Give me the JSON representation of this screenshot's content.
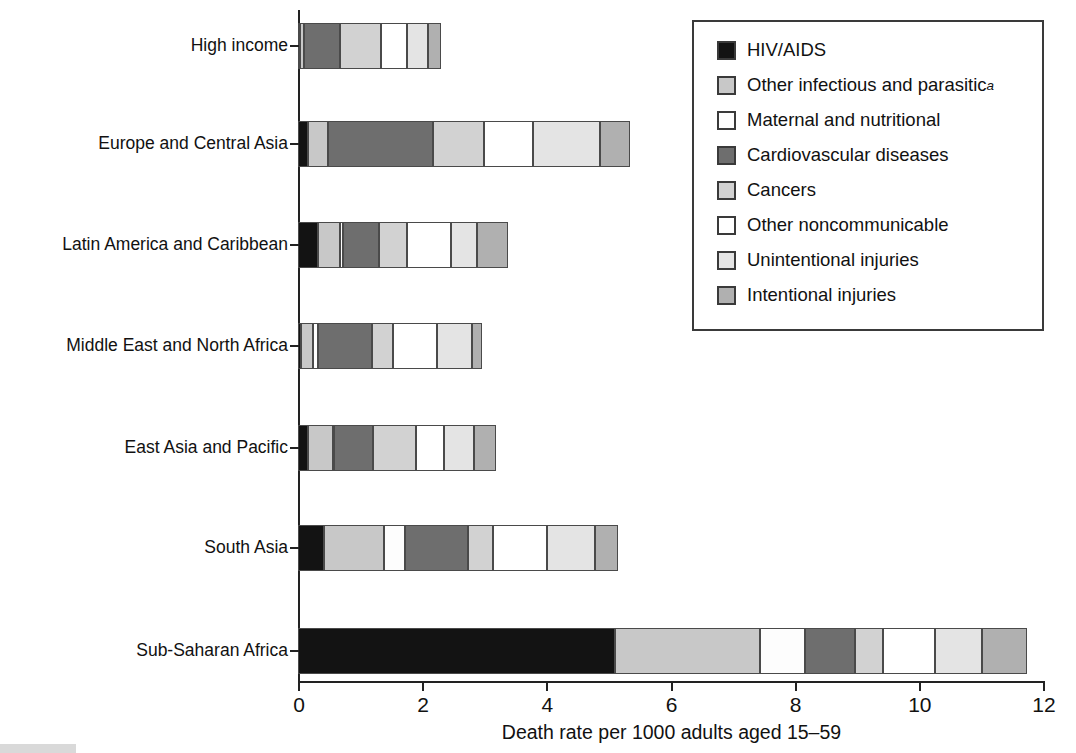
{
  "chart_data": {
    "type": "bar",
    "orientation": "horizontal",
    "stacked": true,
    "title": "",
    "xlabel": "Death rate per 1000 adults aged 15–59",
    "ylabel": "",
    "xlim": [
      0,
      12
    ],
    "xticks": [
      0,
      2,
      4,
      6,
      8,
      10,
      12
    ],
    "xtick_labels": [
      "0",
      "2",
      "4",
      "6",
      "8",
      "10",
      "12"
    ],
    "grid": false,
    "legend_position": "top-right",
    "footnote_marker": "a",
    "categories": [
      "High income",
      "Europe and Central Asia",
      "Latin America and Caribbean",
      "Middle East and North Africa",
      "East Asia and Pacific",
      "South Asia",
      "Sub-Saharan Africa"
    ],
    "series": [
      {
        "name": "HIV/AIDS",
        "color": "#131313",
        "values": [
          0.04,
          0.16,
          0.32,
          0.05,
          0.16,
          0.42,
          5.1
        ]
      },
      {
        "name": "Other infectious and parasitic",
        "color": "#c8c8c8",
        "values": [
          0.05,
          0.32,
          0.36,
          0.19,
          0.4,
          0.97,
          2.34
        ]
      },
      {
        "name": "Maternal and nutritional",
        "color": "#fdfdfd",
        "values": [
          0.01,
          0.01,
          0.05,
          0.08,
          0.02,
          0.33,
          0.72
        ]
      },
      {
        "name": "Cardiovascular diseases",
        "color": "#6e6e6e",
        "values": [
          0.58,
          1.69,
          0.57,
          0.87,
          0.63,
          1.02,
          0.81
        ]
      },
      {
        "name": "Cancers",
        "color": "#d2d2d2",
        "values": [
          0.65,
          0.81,
          0.46,
          0.34,
          0.69,
          0.4,
          0.45
        ]
      },
      {
        "name": "Other noncommunicable",
        "color": "#ffffff",
        "values": [
          0.43,
          0.79,
          0.7,
          0.71,
          0.45,
          0.87,
          0.84
        ]
      },
      {
        "name": "Unintentional injuries",
        "color": "#e4e4e4",
        "values": [
          0.33,
          1.09,
          0.43,
          0.56,
          0.49,
          0.77,
          0.75
        ]
      },
      {
        "name": "Intentional injuries",
        "color": "#b0b0b0",
        "values": [
          0.21,
          0.48,
          0.5,
          0.16,
          0.35,
          0.37,
          0.74
        ]
      }
    ],
    "totals": [
      2.3,
      5.35,
      3.39,
      2.96,
      3.19,
      5.15,
      11.75
    ]
  },
  "legend": {
    "items": [
      {
        "label": "HIV/AIDS",
        "note": "",
        "color": "#131313"
      },
      {
        "label": "Other infectious and parasitic",
        "note": "a",
        "color": "#c8c8c8"
      },
      {
        "label": "Maternal and nutritional",
        "note": "",
        "color": "#fdfdfd"
      },
      {
        "label": "Cardiovascular diseases",
        "note": "",
        "color": "#6e6e6e"
      },
      {
        "label": "Cancers",
        "note": "",
        "color": "#d2d2d2"
      },
      {
        "label": "Other noncommunicable",
        "note": "",
        "color": "#ffffff"
      },
      {
        "label": "Unintentional injuries",
        "note": "",
        "color": "#e4e4e4"
      },
      {
        "label": "Intentional injuries",
        "note": "",
        "color": "#b0b0b0"
      }
    ]
  }
}
